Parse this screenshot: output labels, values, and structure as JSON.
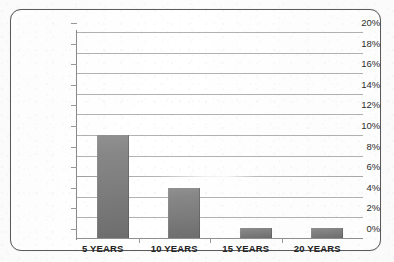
{
  "figure": {
    "background_color": "#fdfdfd",
    "frame_color": "#5b5b5b",
    "gridline_color": "#b2b2b2",
    "bar_color": "#7c7c7c",
    "axis_color": "#8a8a8a"
  },
  "chart_data": {
    "type": "bar",
    "title": "",
    "subtitle": "",
    "xlabel": "",
    "ylabel": "",
    "categories": [
      "5 YEARS",
      "10 YEARS",
      "15 YEARS",
      "20 YEARS"
    ],
    "values": [
      10,
      4.9,
      1,
      1
    ],
    "value_labels": [
      "10%",
      "4.9%",
      "1%",
      "1%"
    ],
    "series": [
      {
        "name": "",
        "values": [
          10,
          4.9,
          1,
          1
        ]
      }
    ],
    "ylim": [
      0,
      20
    ],
    "ytick_step": 2,
    "ytick_labels": [
      "20%",
      "18%",
      "16%",
      "14%",
      "12%",
      "10%",
      "8%",
      "6%",
      "4%",
      "2%",
      "0%"
    ],
    "ytick_values": [
      20,
      18,
      16,
      14,
      12,
      10,
      8,
      6,
      4,
      2,
      0
    ],
    "grid": true,
    "grid_axis": "y",
    "legend": false,
    "legend_position": "none",
    "annotations": []
  }
}
